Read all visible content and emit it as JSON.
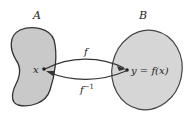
{
  "diagram": {
    "type": "function-mapping",
    "sets": [
      {
        "name": "A",
        "shape": "kidney",
        "fill": "#c9c9c9"
      },
      {
        "name": "B",
        "shape": "ellipse",
        "fill": "#d6d6d6"
      }
    ],
    "points": [
      {
        "label": "x",
        "set": "A"
      },
      {
        "label": "y = f(x)",
        "set": "B"
      }
    ],
    "arrows": [
      {
        "label": "f",
        "from": "x",
        "to": "y = f(x)",
        "direction": "A to B"
      },
      {
        "label": "f",
        "superscript": "−1",
        "from": "y = f(x)",
        "to": "x",
        "direction": "B to A"
      }
    ],
    "colors": {
      "outline": "#333333",
      "arrow": "#333333",
      "text": "#222222"
    }
  }
}
